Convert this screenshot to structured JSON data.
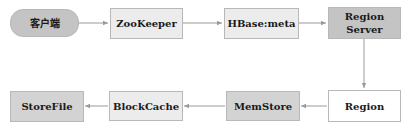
{
  "diagram": {
    "title": "",
    "nodes": [
      {
        "id": "client",
        "label": "客户端",
        "shape": "rounded",
        "fill": "#c4c4c4"
      },
      {
        "id": "zookeeper",
        "label": "ZooKeeper",
        "shape": "rect",
        "fill": "#ececec"
      },
      {
        "id": "hbase_meta",
        "label": "HBase:meta",
        "shape": "rect",
        "fill": "#ececec"
      },
      {
        "id": "region_server",
        "label": "Region Server",
        "line1": "Region",
        "line2": "Server",
        "shape": "rect",
        "fill": "#c4c4c4"
      },
      {
        "id": "region",
        "label": "Region",
        "shape": "rect",
        "fill": "#ffffff"
      },
      {
        "id": "memstore",
        "label": "MemStore",
        "shape": "rect",
        "fill": "#d3d3d3"
      },
      {
        "id": "blockcache",
        "label": "BlockCache",
        "shape": "rect",
        "fill": "#ececec"
      },
      {
        "id": "storefile",
        "label": "StoreFile",
        "shape": "rect",
        "fill": "#d3d3d3"
      }
    ],
    "edges": [
      {
        "from": "client",
        "to": "zookeeper"
      },
      {
        "from": "zookeeper",
        "to": "hbase_meta"
      },
      {
        "from": "hbase_meta",
        "to": "region_server"
      },
      {
        "from": "region_server",
        "to": "region"
      },
      {
        "from": "region",
        "to": "memstore"
      },
      {
        "from": "memstore",
        "to": "blockcache"
      },
      {
        "from": "blockcache",
        "to": "storefile"
      }
    ],
    "edge_color": "#9a9a9a"
  }
}
